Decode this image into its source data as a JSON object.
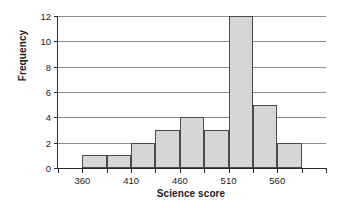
{
  "chart_data": {
    "type": "bar",
    "title": "",
    "xlabel": "Science score",
    "ylabel": "Frequency",
    "xlim": [
      335,
      610
    ],
    "ylim": [
      0,
      12
    ],
    "grid": true,
    "legend": null,
    "bin_width": 25,
    "bin_edges": [
      335,
      360,
      385,
      410,
      435,
      460,
      485,
      510,
      535,
      560,
      585,
      610
    ],
    "categories": [
      "335-360",
      "360-385",
      "385-410",
      "410-435",
      "435-460",
      "460-485",
      "485-510",
      "510-535",
      "535-560",
      "560-585",
      "585-610"
    ],
    "values": [
      0,
      1,
      1,
      2,
      3,
      4,
      3,
      12,
      5,
      2,
      0
    ],
    "xticks": [
      335,
      360,
      385,
      410,
      435,
      460,
      485,
      510,
      535,
      560,
      585,
      610
    ],
    "xtick_labels": [
      "",
      "360",
      "",
      "410",
      "",
      "460",
      "",
      "510",
      "",
      "560",
      "",
      ""
    ],
    "yticks": [
      0,
      2,
      4,
      6,
      8,
      10,
      12
    ],
    "ytick_labels": [
      "0",
      "2",
      "4",
      "6",
      "8",
      "10",
      "12"
    ],
    "bar_fill_color": "#d6d6d6",
    "bar_edge_color": "#4a4a4a",
    "gridline_color": "#8c8c8c",
    "axis_color": "#2b2b2b"
  }
}
